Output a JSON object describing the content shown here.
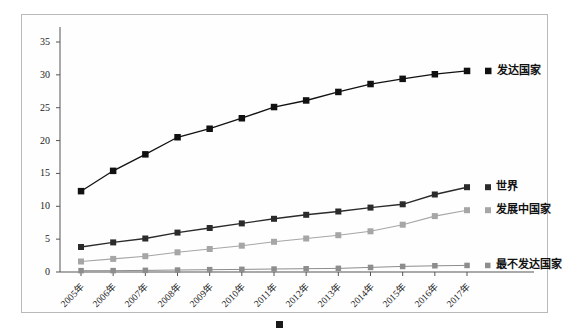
{
  "chart_data": {
    "type": "line",
    "title": "",
    "xlabel": "",
    "ylabel": "",
    "grid": false,
    "legend_position": "right-inline",
    "ylim": [
      0,
      35
    ],
    "yticks": [
      "0",
      "5",
      "10",
      "15",
      "20",
      "25",
      "30",
      "35"
    ],
    "categories": [
      "2005年",
      "2006年",
      "2007年",
      "2008年",
      "2009年",
      "2010年",
      "2011年",
      "2012年",
      "2013年",
      "2014年",
      "2015年",
      "2016年",
      "2017年"
    ],
    "series": [
      {
        "name": "发达国家",
        "color": "#111111",
        "marker": "square",
        "values": [
          12.3,
          15.4,
          17.9,
          20.5,
          21.8,
          23.4,
          25.1,
          26.1,
          27.4,
          28.6,
          29.4,
          30.1,
          30.6
        ]
      },
      {
        "name": "世界",
        "color": "#2b2b2b",
        "marker": "square",
        "values": [
          3.8,
          4.5,
          5.1,
          6.0,
          6.7,
          7.4,
          8.1,
          8.7,
          9.2,
          9.8,
          10.3,
          11.8,
          12.9
        ]
      },
      {
        "name": "发展中国家",
        "color": "#a6a6a6",
        "marker": "square",
        "values": [
          1.6,
          2.0,
          2.4,
          3.0,
          3.5,
          4.0,
          4.6,
          5.1,
          5.6,
          6.2,
          7.2,
          8.5,
          9.4
        ]
      },
      {
        "name": "最不发达国家",
        "color": "#8d8d8d",
        "marker": "square",
        "values": [
          0.2,
          0.2,
          0.25,
          0.3,
          0.35,
          0.4,
          0.45,
          0.5,
          0.55,
          0.7,
          0.85,
          0.95,
          1.0
        ]
      }
    ]
  },
  "axis": {
    "y_labels": [
      "35",
      "30",
      "25",
      "20",
      "15",
      "10",
      "5",
      "0"
    ],
    "x_labels": [
      "2005年",
      "2006年",
      "2007年",
      "2008年",
      "2009年",
      "2010年",
      "2011年",
      "2012年",
      "2013年",
      "2014年",
      "2015年",
      "2016年",
      "2017年"
    ]
  },
  "series_labels": {
    "developed": "发达国家",
    "world": "世界",
    "developing": "发展中国家",
    "least_developed": "最不发达国家"
  },
  "caption": {
    "text": ""
  },
  "colors": {
    "developed": "#111111",
    "world": "#2b2b2b",
    "developing": "#a6a6a6",
    "least_developed": "#8d8d8d",
    "frame": "#b9b9b9",
    "axis": "#555555"
  }
}
